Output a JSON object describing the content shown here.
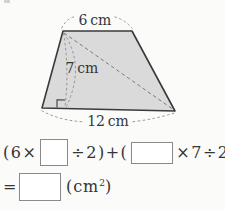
{
  "colors": {
    "page-bg": "#fbfbf9",
    "shape-fill": "#dadada",
    "shape-outline": "#3a3a3a",
    "dash-line": "#8c8c8c",
    "diagonal-line": "#7a7a7a",
    "text-ink": "#353535",
    "box-border": "#8a8a8a"
  },
  "figure": {
    "top_label": "6 cm",
    "height_label": "7 cm",
    "bottom_label": "12 cm"
  },
  "equation": {
    "line1": {
      "seg_a": "(6×",
      "seg_b": "÷2)+(",
      "seg_c": "×7÷2)"
    },
    "line2": {
      "equals": "=",
      "unit_pre": "(cm",
      "unit_sup": "2",
      "unit_post": ")"
    }
  }
}
